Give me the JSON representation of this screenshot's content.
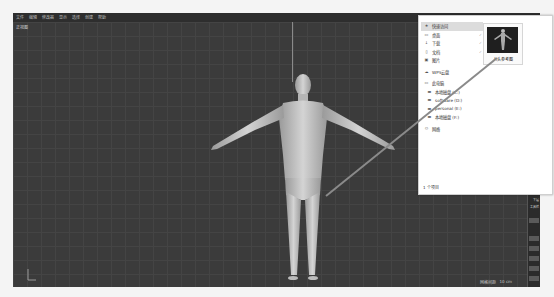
{
  "app": {
    "menubar": {
      "items": [
        "文件",
        "编辑",
        "修改器",
        "显示",
        "选择",
        "创建",
        "帮助"
      ]
    },
    "viewport": {
      "label": "正视图",
      "scene_object": "human-figure-t-pose",
      "status": {
        "left": "网格间距",
        "right": "10 cm"
      },
      "colors": {
        "background": "#3b3b3b",
        "grid": "#444444",
        "figure": "#c8c8c8"
      }
    },
    "right_strip": {
      "labels": [
        "下层",
        "工具栏"
      ]
    }
  },
  "explorer": {
    "nav": [
      {
        "icon": "star-icon",
        "label": "快速访问",
        "active": true,
        "pinned": false
      },
      {
        "icon": "desktop-icon",
        "label": "桌面",
        "active": false,
        "pinned": true
      },
      {
        "icon": "download-icon",
        "label": "下载",
        "active": false,
        "pinned": true
      },
      {
        "icon": "document-icon",
        "label": "文档",
        "active": false,
        "pinned": true
      },
      {
        "icon": "picture-icon",
        "label": "图片",
        "active": false,
        "pinned": false
      },
      {
        "icon": "cloud-icon",
        "label": "WPS云盘",
        "active": false,
        "pinned": false
      },
      {
        "icon": "computer-icon",
        "label": "此电脑",
        "active": false,
        "pinned": false
      },
      {
        "icon": "drive-icon",
        "label": "本地磁盘 (C:)",
        "active": false,
        "pinned": false,
        "sub": true
      },
      {
        "icon": "drive-icon",
        "label": "software (D:)",
        "active": false,
        "pinned": false,
        "sub": true
      },
      {
        "icon": "drive-icon",
        "label": "personal (E:)",
        "active": false,
        "pinned": false,
        "sub": true
      },
      {
        "icon": "drive-icon",
        "label": "本地磁盘 (F:)",
        "active": false,
        "pinned": false,
        "sub": true
      },
      {
        "icon": "network-icon",
        "label": "网络",
        "active": false,
        "pinned": false
      }
    ],
    "file": {
      "name": "人头参考图"
    },
    "item_count": "1 个项目",
    "pin_glyph": "✓"
  }
}
